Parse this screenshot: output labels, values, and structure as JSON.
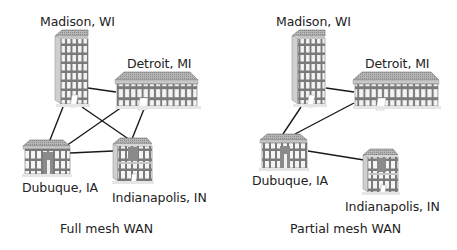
{
  "diagrams": [
    {
      "caption": "Full mesh WAN",
      "nodes": {
        "madison": "Madison, WI",
        "detroit": "Detroit, MI",
        "dubuque": "Dubuque, IA",
        "indianapolis": "Indianapolis, IN"
      },
      "links": [
        [
          "Madison, WI",
          "Detroit, MI"
        ],
        [
          "Madison, WI",
          "Dubuque, IA"
        ],
        [
          "Madison, WI",
          "Indianapolis, IN"
        ],
        [
          "Detroit, MI",
          "Dubuque, IA"
        ],
        [
          "Detroit, MI",
          "Indianapolis, IN"
        ],
        [
          "Dubuque, IA",
          "Indianapolis, IN"
        ]
      ]
    },
    {
      "caption": "Partial mesh WAN",
      "nodes": {
        "madison": "Madison, WI",
        "detroit": "Detroit, MI",
        "dubuque": "Dubuque, IA",
        "indianapolis": "Indianapolis, IN"
      },
      "links": [
        [
          "Madison, WI",
          "Detroit, MI"
        ],
        [
          "Madison, WI",
          "Dubuque, IA"
        ],
        [
          "Detroit, MI",
          "Dubuque, IA"
        ],
        [
          "Dubuque, IA",
          "Indianapolis, IN"
        ]
      ]
    }
  ],
  "colors": {
    "line": "#1a1a1a",
    "building_face": "#d9d9d9",
    "building_roof": "#a8a8a8",
    "window": "#ffffff",
    "frame": "#6e6e6e"
  }
}
